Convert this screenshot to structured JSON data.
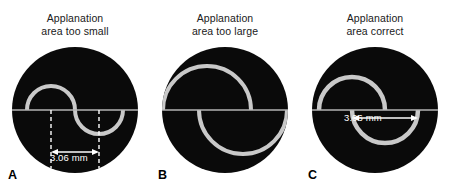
{
  "figure": {
    "background_color": "#ffffff",
    "disc_color": "#0a0a0a",
    "mire_color": "#c8c8c8",
    "measurement_color": "#ffffff"
  },
  "panels": [
    {
      "letter": "A",
      "caption": "Applanation\narea too small",
      "caption_line1": "Applanation",
      "caption_line2": "area too small",
      "measurement": "3.06 mm",
      "measurement_position": "below-disc",
      "mire_radius_px": 24,
      "overlap": "separated",
      "has_dashed_guides": true,
      "has_arrow_dimension": true
    },
    {
      "letter": "B",
      "caption": "Applanation\narea too large",
      "caption_line1": "Applanation",
      "caption_line2": "area too large",
      "measurement": "",
      "measurement_position": "none",
      "mire_radius_px": 44,
      "overlap": "overlapping",
      "has_dashed_guides": false,
      "has_arrow_dimension": false
    },
    {
      "letter": "C",
      "caption": "Applanation\narea correct",
      "caption_line1": "Applanation",
      "caption_line2": "area correct",
      "measurement": "3.06 mm",
      "measurement_position": "inside-disc",
      "mire_radius_px": 33,
      "overlap": "inner-edges-touching",
      "has_dashed_guides": false,
      "has_arrow_dimension": true
    }
  ]
}
